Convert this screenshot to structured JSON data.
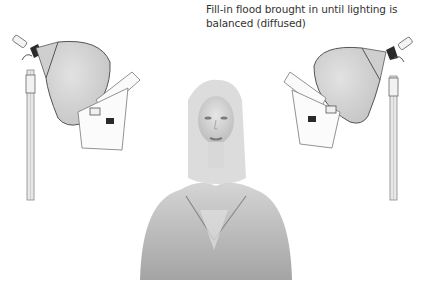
{
  "caption": {
    "lines": [
      "Fill-in flood brought in until lighting is",
      "balanced (diffused)"
    ]
  },
  "illustration": {
    "subject": "portrait of a woman with long blonde hair, grayscale",
    "left_light": "flood lamp on stand with barn door diffuser, facing right",
    "right_light": "flood lamp on stand with barn door diffuser, facing left"
  },
  "colors": {
    "background": "#ffffff",
    "text": "#333333",
    "reflector": "#d8d8d8",
    "outline": "#555555",
    "dark_part": "#2a2a2a"
  }
}
